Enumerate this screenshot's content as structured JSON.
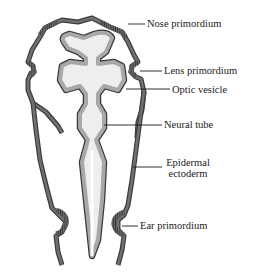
{
  "diagram": {
    "colors": {
      "epidermis_outer": "#3c3c3c",
      "epidermis_fill": "#6e6e6e",
      "neural_tube_fill": "#a8a8a8",
      "neural_tube_outline": "#3a3a3a",
      "lumen": "#eeeeee",
      "background": "#ffffff",
      "leader_line": "#1a1a1a"
    },
    "labels": {
      "nose": "Nose primordium",
      "lens": "Lens primordium",
      "optic": "Optic vesicle",
      "neural": "Neural tube",
      "epidermal_line1": "Epidermal",
      "epidermal_line2": "ectoderm",
      "ear": "Ear primordium"
    }
  }
}
